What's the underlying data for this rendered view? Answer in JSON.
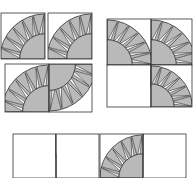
{
  "diagram": {
    "title": "",
    "colors": {
      "fabric_gray": "#b9b9b9",
      "outline": "#333333",
      "background": "#ffffff"
    },
    "groups": [
      {
        "name": "layout-a",
        "blocks": [
          {
            "x": 1,
            "y": 13,
            "w": 44,
            "h": 46,
            "cx": 45,
            "cy": 59,
            "rot": 0
          },
          {
            "x": 48,
            "y": 13,
            "w": 44,
            "h": 46,
            "cx": 92,
            "cy": 59,
            "rot": 0
          },
          {
            "x": 5,
            "y": 64,
            "w": 44,
            "h": 48,
            "cx": 49,
            "cy": 112,
            "rot": 0
          },
          {
            "x": 49,
            "y": 64,
            "w": 43,
            "h": 48,
            "cx": 49,
            "cy": 64,
            "rot": 180
          }
        ]
      },
      {
        "name": "layout-b",
        "blocks": [
          {
            "x": 107,
            "y": 19,
            "w": 44,
            "h": 46,
            "cx": 107,
            "cy": 65,
            "rot": 90
          },
          {
            "x": 151,
            "y": 19,
            "w": 41,
            "h": 46,
            "cx": 151,
            "cy": 65,
            "rot": 90
          },
          {
            "x": 107,
            "y": 65,
            "w": 44,
            "h": 42,
            "cx": 151,
            "cy": 65,
            "rot": 180
          },
          {
            "x": 151,
            "y": 65,
            "w": 41,
            "h": 42,
            "cx": 151,
            "cy": 107,
            "rot": 90
          }
        ]
      },
      {
        "name": "layout-c",
        "blocks": [
          {
            "x": 13,
            "y": 134,
            "w": 43,
            "h": 44,
            "cx": 56,
            "cy": 134,
            "rot": 180
          },
          {
            "x": 56,
            "y": 134,
            "w": 43,
            "h": 44,
            "cx": 56,
            "cy": 178,
            "rot": 0
          },
          {
            "x": 100,
            "y": 134,
            "w": 43,
            "h": 44,
            "cx": 143,
            "cy": 178,
            "rot": 0
          },
          {
            "x": 143,
            "y": 134,
            "w": 43,
            "h": 44,
            "cx": 143,
            "cy": 134,
            "rot": 270
          }
        ]
      }
    ],
    "arc": {
      "inner_ratio": 0.55,
      "outer_ratio": 0.98,
      "spikes": 6
    }
  }
}
